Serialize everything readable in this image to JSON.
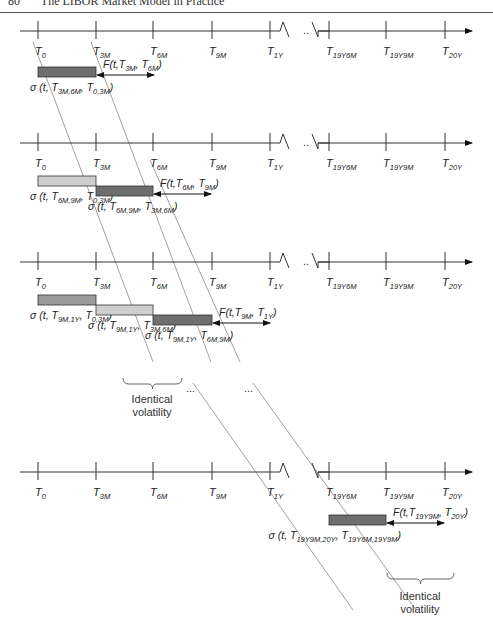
{
  "header": {
    "page_number": "80",
    "running_title": "The LIBOR Market Model in Practice"
  },
  "colors": {
    "dark_bar": "#6e6e6e",
    "medium_bar": "#9a9a9a",
    "light_bar": "#cfcfcf",
    "axis": "#333333"
  },
  "ticks": [
    {
      "id": "T0",
      "base": "T",
      "sub": "0",
      "x": 38
    },
    {
      "id": "T3M",
      "base": "T",
      "sub": "3M",
      "x": 96
    },
    {
      "id": "T6M",
      "base": "T",
      "sub": "6M",
      "x": 153
    },
    {
      "id": "T9M",
      "base": "T",
      "sub": "9M",
      "x": 212
    },
    {
      "id": "T1Y",
      "base": "T",
      "sub": "1Y",
      "x": 270
    },
    {
      "id": "T19Y6M",
      "base": "T",
      "sub": "19Y6M",
      "x": 329
    },
    {
      "id": "T19Y9M",
      "base": "T",
      "sub": "19Y9M",
      "x": 386
    },
    {
      "id": "T20Y",
      "base": "T",
      "sub": "20Y",
      "x": 445
    }
  ],
  "timelines": [
    {
      "id": "timeline-1",
      "y": 31
    },
    {
      "id": "timeline-2",
      "y": 143
    },
    {
      "id": "timeline-3",
      "y": 262
    },
    {
      "id": "timeline-4",
      "y": 472
    }
  ],
  "sections": [
    {
      "forward": {
        "label": "F(t, T3M, T6M)",
        "base": "F(t,T",
        "s1": "3M",
        "mid": ", T",
        "s2": "6M",
        "end": ")"
      },
      "bars": [
        {
          "x1": 38,
          "x2": 96,
          "y": 72,
          "shade": "dark_bar",
          "label": "σ(t, T3M,6M, T0,3M)",
          "base": "σ (t, T",
          "s1": "3M,6M",
          "mid": ", T",
          "s2": "0,3M",
          "end": ")"
        }
      ]
    },
    {
      "forward": {
        "label": "F(t, T6M, T9M)",
        "base": "F(t,T",
        "s1": "6M",
        "mid": ", T",
        "s2": "9M",
        "end": ")"
      },
      "bars": [
        {
          "x1": 38,
          "x2": 96,
          "y": 181,
          "shade": "light_bar",
          "label": "σ(t, T6M,9M, T0,3M)",
          "base": "σ (t, T",
          "s1": "6M,9M",
          "mid": ", T",
          "s2": "0,3M",
          "end": ")"
        },
        {
          "x1": 96,
          "x2": 153,
          "y": 191,
          "shade": "dark_bar",
          "label": "σ(t, T6M,9M, T3M,6M)",
          "base": "σ (t, T",
          "s1": "6M,9M",
          "mid": ", T",
          "s2": "3M,6M",
          "end": ")"
        }
      ]
    },
    {
      "forward": {
        "label": "F(t, T9M, T1Y)",
        "base": "F(t,T",
        "s1": "9M",
        "mid": ", T",
        "s2": "1Y",
        "end": ")"
      },
      "bars": [
        {
          "x1": 38,
          "x2": 96,
          "y": 300,
          "shade": "medium_bar",
          "label": "σ(t, T9M,1Y, T0,3M)",
          "base": "σ (t, T",
          "s1": "9M,1Y",
          "mid": ", T",
          "s2": "0,3M",
          "end": ")"
        },
        {
          "x1": 96,
          "x2": 153,
          "y": 310,
          "shade": "light_bar",
          "label": "σ(t, T9M,1Y, T3M,6M)",
          "base": "σ (t, T",
          "s1": "9M,1Y",
          "mid": ", T",
          "s2": "3M,6M",
          "end": ")"
        },
        {
          "x1": 153,
          "x2": 212,
          "y": 320,
          "shade": "dark_bar",
          "label": "σ(t, T9M,1Y, T6M,9M)",
          "base": "σ (t, T",
          "s1": "9M,1Y",
          "mid": ", T",
          "s2": "6M,9M",
          "end": ")"
        }
      ]
    },
    {
      "forward": {
        "label": "F(t, T19Y9M, T20Y)",
        "base": "F(t,T",
        "s1": "19Y9M",
        "mid": ", T",
        "s2": "20Y",
        "end": ")"
      },
      "bars": [
        {
          "x1": 329,
          "x2": 386,
          "y": 520,
          "shade": "dark_bar",
          "label": "σ(t, T19Y9M,20Y, T19Y6M,19Y9M)",
          "base": "σ (t, T",
          "s1": "19Y9M,20Y",
          "mid": ", T",
          "s2": "19Y6M,19Y9M",
          "end": ")"
        }
      ]
    }
  ],
  "annotations": {
    "identical_volatility_1": {
      "line1": "Identical",
      "line2": "volatility"
    },
    "identical_volatility_2": {
      "line1": "Identical",
      "line2": "volatility"
    },
    "ellipsis_1": "...",
    "ellipsis_2": "...",
    "break_ellipsis": ".."
  }
}
